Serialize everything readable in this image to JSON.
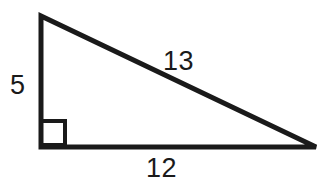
{
  "figure": {
    "name": "right-triangle",
    "background_color": "#ffffff",
    "stroke_color": "#1a1a1a",
    "label_color": "#1a1a1a"
  },
  "labels": {
    "vertical_leg": "5",
    "hypotenuse": "13",
    "horizontal_leg": "12"
  },
  "geometry": {
    "apex": {
      "x": 41,
      "y": 16
    },
    "right_angle_vertex": {
      "x": 41,
      "y": 147
    },
    "far_vertex": {
      "x": 316,
      "y": 147
    },
    "right_angle_marker": {
      "x": 41,
      "y": 121,
      "size": 24
    },
    "stroke_width": 5
  }
}
